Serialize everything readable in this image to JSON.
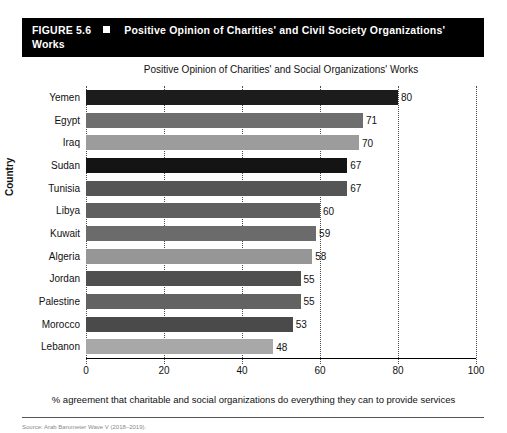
{
  "figure": {
    "number": "FIGURE 5.6",
    "bullet": "square-marker",
    "title": "Positive Opinion of Charities' and Civil Society Organizations' Works"
  },
  "source": {
    "text": "Source: Arab Barometer Wave V (2018–2019)."
  },
  "chart_data": {
    "type": "bar",
    "orientation": "horizontal",
    "title": "Positive Opinion of Charities' and Social Organizations' Works",
    "xlabel": "% agreement that charitable and social organizations do everything they can to provide services",
    "ylabel": "Country",
    "xlim": [
      0,
      100
    ],
    "xticks": [
      0,
      20,
      40,
      60,
      80,
      100
    ],
    "grid": "vertical-dotted",
    "legend": "none",
    "categories": [
      "Yemen",
      "Egypt",
      "Iraq",
      "Sudan",
      "Tunisia",
      "Libya",
      "Kuwait",
      "Algeria",
      "Jordan",
      "Palestine",
      "Morocco",
      "Lebanon"
    ],
    "values": [
      80,
      71,
      70,
      67,
      67,
      60,
      59,
      58,
      55,
      55,
      53,
      48
    ],
    "bar_colors": [
      "#1c1c1c",
      "#6e6e6e",
      "#9c9c9c",
      "#141414",
      "#555555",
      "#5f5f5f",
      "#6b6b6b",
      "#969696",
      "#4f4f4f",
      "#626262",
      "#4a4a4a",
      "#a8a8a8"
    ]
  }
}
